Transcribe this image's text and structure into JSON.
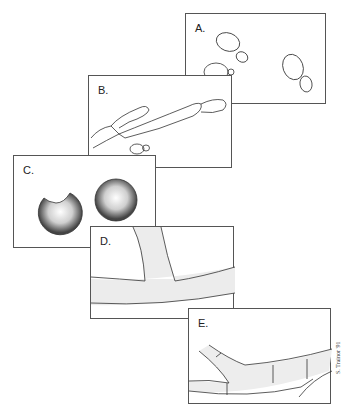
{
  "figure": {
    "panels": [
      {
        "id": "A",
        "label": "A.",
        "content": "budding-yeast-cells"
      },
      {
        "id": "B",
        "label": "B.",
        "content": "pseudohyphae"
      },
      {
        "id": "C",
        "label": "C.",
        "content": "chlamydospores"
      },
      {
        "id": "D",
        "label": "D.",
        "content": "branching-hypha"
      },
      {
        "id": "E",
        "label": "E.",
        "content": "septate-hyphae"
      }
    ],
    "signature": "S. Trainor '91",
    "colors": {
      "line": "#333333",
      "border": "#555555",
      "stipple": "#9a9a9a",
      "background": "#ffffff"
    }
  }
}
